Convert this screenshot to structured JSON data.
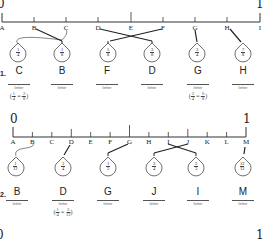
{
  "problems": [
    {
      "number": "1.",
      "start_label": "0",
      "end_label": "1",
      "ticks": [
        "A",
        "B",
        "C",
        "D",
        "E",
        "F",
        "G",
        "H",
        "I"
      ],
      "tags": [
        {
          "num": "1",
          "den": "4",
          "points_to": "C"
        },
        {
          "num": "1",
          "den": "8",
          "points_to": "B"
        },
        {
          "num": "5",
          "den": "8",
          "points_to": "F"
        },
        {
          "num": "3",
          "den": "8",
          "points_to": "D"
        },
        {
          "num": "3",
          "den": "4",
          "points_to": "G"
        },
        {
          "num": "7",
          "den": "8",
          "points_to": "H"
        }
      ],
      "answers": [
        "C",
        "B",
        "F",
        "D",
        "G",
        "H"
      ],
      "answer_caption": "letter",
      "equivalences": [
        {
          "under": 0,
          "a_num": "1",
          "a_den": "4",
          "b_num": "2",
          "b_den": "8"
        },
        {
          "under": 4,
          "a_num": "3",
          "a_den": "4",
          "b_num": "6",
          "b_den": "8"
        }
      ]
    },
    {
      "number": "2.",
      "start_label": "0",
      "end_label": "1",
      "ticks": [
        "A",
        "B",
        "C",
        "D",
        "E",
        "F",
        "G",
        "H",
        "I",
        "J",
        "K",
        "L",
        "M"
      ],
      "tags": [
        {
          "num": "1",
          "den": "12",
          "points_to": "B"
        },
        {
          "num": "1",
          "den": "4",
          "points_to": "D"
        },
        {
          "num": "1",
          "den": "2",
          "points_to": "G"
        },
        {
          "num": "3",
          "den": "4",
          "points_to": "J"
        },
        {
          "num": "2",
          "den": "3",
          "points_to": "I"
        },
        {
          "num": "12",
          "den": "12",
          "points_to": "M"
        }
      ],
      "answers": [
        "B",
        "D",
        "G",
        "J",
        "I",
        "M"
      ],
      "answer_caption": "letter",
      "equivalences": [
        {
          "under": 1,
          "a_num": "1",
          "a_den": "4",
          "b_num": "3",
          "b_den": "12"
        }
      ]
    },
    {
      "start_label": "0",
      "end_label": "1"
    }
  ]
}
